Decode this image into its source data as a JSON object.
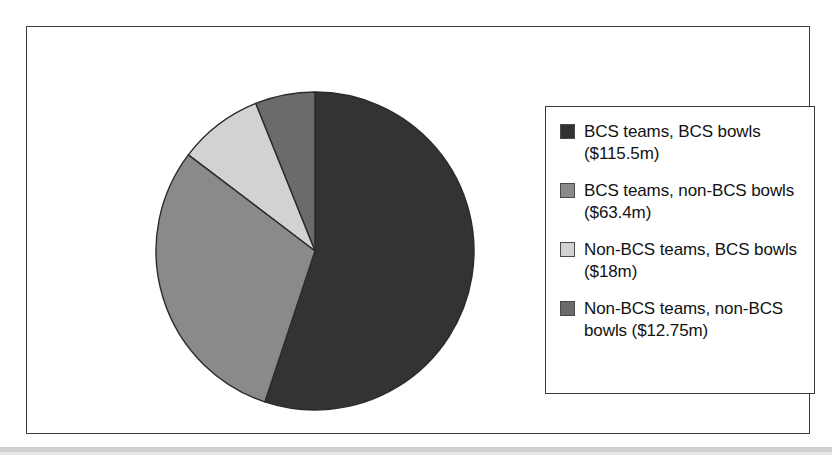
{
  "chart_data": {
    "type": "pie",
    "title": "",
    "subtitle": "",
    "xlabel": "",
    "ylabel": "",
    "grid": false,
    "legend_position": "right",
    "units": "$ millions",
    "total": 209.65,
    "start_angle_deg": 90,
    "direction": "counterclockwise",
    "categories": [
      "BCS teams, BCS bowls",
      "BCS teams, non-BCS bowls",
      "Non-BCS teams, BCS bowls",
      "Non-BCS teams, non-BCS bowls"
    ],
    "values": [
      115.5,
      63.4,
      18,
      12.75
    ],
    "value_labels": [
      "$115.5m",
      "$63.4m",
      "$18m",
      "$12.75m"
    ],
    "percentages": [
      55.1,
      30.2,
      8.6,
      6.1
    ],
    "colors": [
      "#333333",
      "#8a8a8a",
      "#d2d2d2",
      "#6b6b6b"
    ],
    "slices": [
      {
        "name": "BCS teams, BCS bowls",
        "value": 115.5,
        "value_label": "$115.5m",
        "percent": 55.1,
        "color": "#333333",
        "start_angle_deg": 90,
        "end_angle_deg": -108.4
      },
      {
        "name": "Non-BCS teams, non-BCS bowls",
        "value": 12.75,
        "value_label": "$12.75m",
        "percent": 6.1,
        "color": "#6b6b6b",
        "start_angle_deg": 90,
        "end_angle_deg": 111.9
      },
      {
        "name": "Non-BCS teams, BCS bowls",
        "value": 18,
        "value_label": "$18m",
        "percent": 8.6,
        "color": "#d2d2d2",
        "start_angle_deg": 111.9,
        "end_angle_deg": 142.8
      },
      {
        "name": "BCS teams, non-BCS bowls",
        "value": 63.4,
        "value_label": "$63.4m",
        "percent": 30.2,
        "color": "#8a8a8a",
        "start_angle_deg": 142.8,
        "end_angle_deg": 251.6
      }
    ]
  },
  "legend": {
    "items": [
      {
        "label": "BCS teams, BCS bowls ($115.5m)",
        "color": "#333333",
        "swatch_name": "legend-swatch-bcs-teams-bcs-bowls"
      },
      {
        "label": "BCS teams, non-BCS bowls ($63.4m)",
        "color": "#8a8a8a",
        "swatch_name": "legend-swatch-bcs-teams-non-bcs-bowls"
      },
      {
        "label": "Non-BCS teams, BCS bowls ($18m)",
        "color": "#d2d2d2",
        "swatch_name": "legend-swatch-non-bcs-teams-bcs-bowls"
      },
      {
        "label": "Non-BCS teams, non-BCS bowls ($12.75m)",
        "color": "#6b6b6b",
        "swatch_name": "legend-swatch-non-bcs-teams-non-bcs-bowls"
      }
    ]
  },
  "style": {
    "frame_color": "#3a3a3a",
    "background": "#ffffff",
    "text_color": "#121212",
    "slice_outline": "#2b2b2b"
  }
}
